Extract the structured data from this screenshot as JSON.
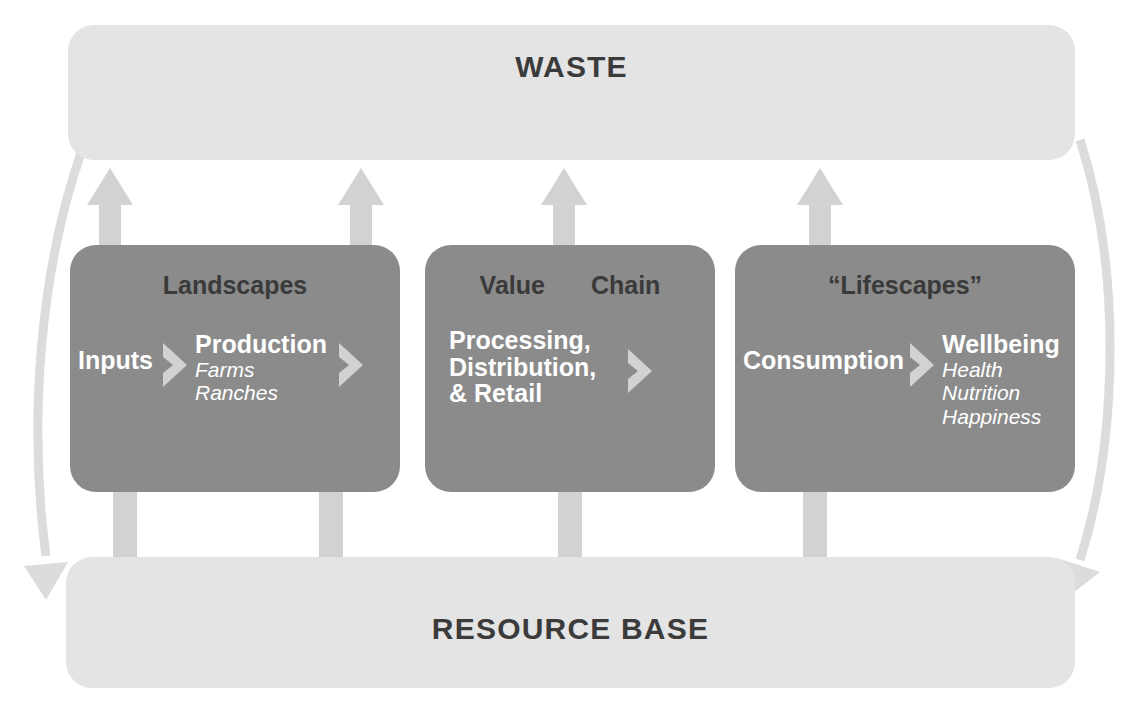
{
  "diagram": {
    "title_top": "WASTE",
    "title_bottom": "RESOURCE BASE",
    "colors": {
      "band_fill": "#e4e4e4",
      "stage_fill": "#8b8b8b",
      "arrow_fill": "#d2d2d2",
      "dark_text": "#3a3a3a",
      "light_text": "#ffffff"
    },
    "stages": [
      {
        "id": "landscapes",
        "title": "Landscapes",
        "nodes": [
          {
            "name": "Inputs",
            "sub": []
          },
          {
            "name": "Production",
            "sub": [
              "Farms",
              "Ranches"
            ]
          }
        ]
      },
      {
        "id": "valuechain",
        "title_parts": [
          "Value",
          "Chain"
        ],
        "nodes": [
          {
            "name": "Processing,",
            "name2": "Distribution,",
            "name3": "& Retail",
            "sub": []
          }
        ]
      },
      {
        "id": "lifescapes",
        "title": "“Lifescapes”",
        "nodes": [
          {
            "name": "Consumption",
            "sub": []
          },
          {
            "name": "Wellbeing",
            "sub": [
              "Health",
              "Nutrition",
              "Happiness"
            ]
          }
        ]
      }
    ],
    "icons": {
      "chevron": "chevron-right-icon",
      "arrow_up": "arrow-up-icon",
      "arrow_curve": "curved-arrow-icon"
    }
  }
}
